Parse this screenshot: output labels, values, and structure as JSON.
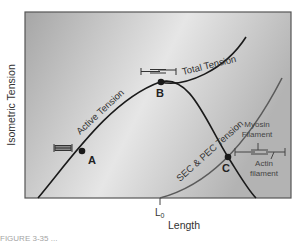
{
  "diagram": {
    "y_axis_label": "Isometric Tension",
    "x_axis_label": "Length",
    "x_marker": "L",
    "x_marker_sub": "0",
    "curves": {
      "active": "Active Tension",
      "total": "Total Tension",
      "passive": "SEC & PEC Tension"
    },
    "points": {
      "a": "A",
      "b": "B",
      "c": "C"
    },
    "legend": {
      "myosin": "Myosin",
      "myosin_2": "Filament",
      "actin": "Actin",
      "actin_2": "filament"
    },
    "caption": "FIGURE 3-35 ..."
  },
  "colors": {
    "frame": "#555555",
    "curve": "#1a1a1a",
    "passive_curve": "#5a5a5a",
    "bg_dark": "#a9a9a9",
    "bg_light": "#ebebeb"
  }
}
